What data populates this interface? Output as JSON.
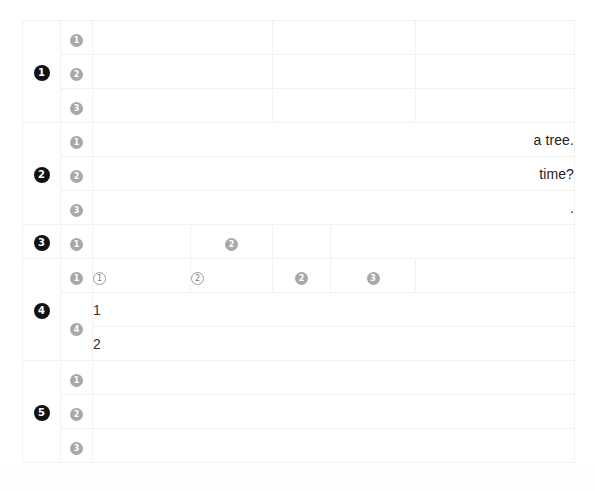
{
  "document": {
    "title": "Outline Table",
    "background_color": "#ffffff",
    "border_color": "#f2f2f2",
    "marker_black_color": "#121212",
    "marker_gray_color": "#a8a8a8",
    "marker_outline_color": "#9b9b9b"
  },
  "markers": {
    "black_1": "1",
    "black_2": "2",
    "black_3": "3",
    "black_4": "4",
    "black_5": "5",
    "gray_1": "1",
    "gray_2": "2",
    "gray_3": "3",
    "gray_4": "4",
    "outline_1": "1",
    "outline_2": "2"
  },
  "sections": [
    {
      "number": "1",
      "rows": [
        {
          "marker": "1",
          "text": ""
        },
        {
          "marker": "2",
          "text": ""
        },
        {
          "marker": "3",
          "text": ""
        }
      ]
    },
    {
      "number": "2",
      "rows": [
        {
          "marker": "1",
          "text": "a tree."
        },
        {
          "marker": "2",
          "text": "time?"
        },
        {
          "marker": "3",
          "text": "."
        }
      ]
    },
    {
      "number": "3",
      "rows": [
        {
          "marker": "1",
          "text": ""
        },
        {
          "marker": "2",
          "text": ""
        }
      ]
    },
    {
      "number": "4",
      "header_markers": [
        "1",
        "1",
        "2",
        "2",
        "3"
      ],
      "sub_rows": [
        {
          "marker": "4",
          "text": "1"
        },
        {
          "marker": "",
          "text": "2"
        }
      ]
    },
    {
      "number": "5",
      "rows": [
        {
          "marker": "1",
          "text": ""
        },
        {
          "marker": "2",
          "text": ""
        },
        {
          "marker": "3",
          "text": ""
        }
      ]
    }
  ],
  "scrollbar": {
    "label": "vertical-scrollbar",
    "thumb_color": "#808080"
  }
}
